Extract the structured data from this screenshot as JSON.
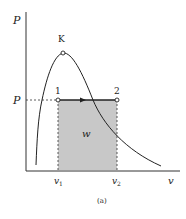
{
  "diagram": {
    "type": "P-v diagram",
    "axes": {
      "y_label": "P",
      "x_label": "v"
    },
    "critical_point": {
      "label": "K"
    },
    "pressure_level": {
      "label": "P"
    },
    "states": [
      {
        "label": "1",
        "v_label": "v",
        "v_sub": "1"
      },
      {
        "label": "2",
        "v_label": "v",
        "v_sub": "2"
      }
    ],
    "work_area": {
      "label": "w",
      "fill": "#c8c8c8"
    },
    "caption": "(a)",
    "colors": {
      "line": "#222222",
      "shade": "#c8c8c8",
      "background": "#ffffff"
    }
  }
}
